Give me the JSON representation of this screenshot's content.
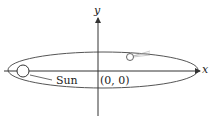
{
  "diagram": {
    "labels": {
      "x_axis": "x",
      "y_axis": "y",
      "sun": "Sun",
      "origin": "(0, 0)"
    },
    "colors": {
      "stroke": "#444444",
      "fill": "#ffffff"
    }
  }
}
